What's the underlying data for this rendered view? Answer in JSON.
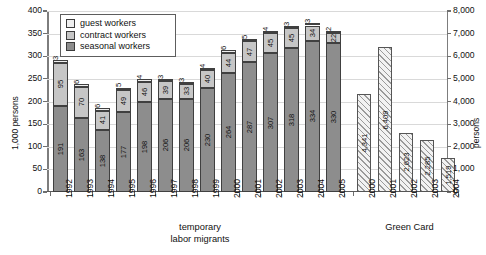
{
  "chart_data": {
    "type": "bar",
    "title": "",
    "subtitle": "",
    "ylabel": "1,000 persons",
    "ylabel_right": "persons",
    "xlabel": "",
    "ylim": [
      0,
      400
    ],
    "ylim_right": [
      0,
      8000
    ],
    "grid": true,
    "legend_position": "top-left",
    "legend": [
      "guest workers",
      "contract workers",
      "seasonal workers"
    ],
    "ytick_labels_left": [
      "0",
      "50",
      "100",
      "150",
      "200",
      "250",
      "300",
      "350",
      "400"
    ],
    "ytick_values_left": [
      0,
      50,
      100,
      150,
      200,
      250,
      300,
      350,
      400
    ],
    "ytick_labels_right": [
      "0",
      "1,000",
      "2,000",
      "3,000",
      "4,000",
      "5,000",
      "6,000",
      "7,000",
      "8,000"
    ],
    "ytick_values_right": [
      0,
      1000,
      2000,
      3000,
      4000,
      5000,
      6000,
      7000,
      8000
    ],
    "groups": [
      {
        "name": "temporary\nlabor migrants",
        "axis": "left",
        "stacked": true,
        "categories": [
          "1992",
          "1993",
          "1994",
          "1995",
          "1996",
          "1997",
          "1998",
          "1999",
          "2000",
          "2001",
          "2002",
          "2003",
          "2004",
          "2005"
        ],
        "series": [
          {
            "name": "seasonal workers",
            "values": [
              191,
              163,
              138,
              177,
              198,
              206,
              206,
              230,
              264,
              287,
              307,
              318,
              334,
              330
            ]
          },
          {
            "name": "contract workers",
            "values": [
              95,
              70,
              41,
              49,
              46,
              39,
              33,
              40,
              44,
              47,
              45,
              45,
              34,
              22
            ]
          },
          {
            "name": "guest workers",
            "values": [
              3,
              6,
              6,
              5,
              4,
              3,
              3,
              4,
              6,
              5,
              4,
              3,
              3,
              2
            ]
          }
        ]
      },
      {
        "name": "Green Card",
        "axis": "right",
        "stacked": false,
        "categories": [
          "2000",
          "2001",
          "2002",
          "2003",
          "2004"
        ],
        "series": [
          {
            "name": "Green Card",
            "values": [
              4341,
              6409,
              2623,
              2285,
              1519
            ]
          }
        ],
        "value_labels": [
          "4,341",
          "6,409",
          "2,623",
          "2,285",
          "1,519"
        ]
      }
    ]
  }
}
